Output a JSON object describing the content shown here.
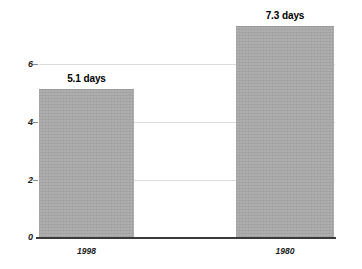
{
  "chart_data": {
    "type": "bar",
    "title": "",
    "subtitle": "",
    "xlabel": "",
    "ylabel": "",
    "categories": [
      "1998",
      "1980"
    ],
    "values": [
      5.1,
      7.3
    ],
    "data_labels": [
      "5.1 days",
      "7.3 days"
    ],
    "ylim": [
      0,
      7.6
    ],
    "yticks": [
      "0",
      "2",
      "4",
      "6"
    ],
    "ytick_values": [
      0,
      2,
      4,
      6
    ],
    "grid": "horizontal",
    "legend": "none",
    "series": [
      {
        "name": "days",
        "values": [
          5.1,
          7.3
        ],
        "color": "#a9a9a9"
      }
    ]
  },
  "colors": {
    "bar_fill": "#a9a9a9",
    "gridline": "#dcdcdc",
    "axis": "#3a3a3a",
    "text": "#1a1a1a",
    "background": "#ffffff"
  }
}
